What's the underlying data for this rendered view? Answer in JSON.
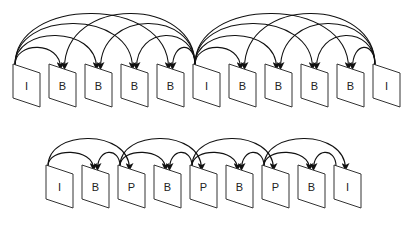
{
  "diagram": {
    "colors": {
      "stroke": "#111111",
      "frame_stroke": "#333333",
      "background": "#ffffff"
    },
    "rows": [
      {
        "id": "hierarchical-b",
        "frame_y": 64,
        "frame_x_start": 13,
        "frame_spacing": 36,
        "frames": [
          "I",
          "B",
          "B",
          "B",
          "B",
          "I",
          "B",
          "B",
          "B",
          "B",
          "I"
        ],
        "arcs": [
          {
            "from": 0,
            "to": 1,
            "h": 18
          },
          {
            "from": 0,
            "to": 2,
            "h": 30
          },
          {
            "from": 0,
            "to": 3,
            "h": 42
          },
          {
            "from": 0,
            "to": 4,
            "h": 52
          },
          {
            "from": 5,
            "to": 4,
            "h": 18
          },
          {
            "from": 5,
            "to": 3,
            "h": 30
          },
          {
            "from": 5,
            "to": 2,
            "h": 42
          },
          {
            "from": 5,
            "to": 1,
            "h": 52
          },
          {
            "from": 5,
            "to": 6,
            "h": 18
          },
          {
            "from": 5,
            "to": 7,
            "h": 30
          },
          {
            "from": 5,
            "to": 8,
            "h": 42
          },
          {
            "from": 5,
            "to": 9,
            "h": 52
          },
          {
            "from": 10,
            "to": 9,
            "h": 18
          },
          {
            "from": 10,
            "to": 8,
            "h": 30
          },
          {
            "from": 10,
            "to": 7,
            "h": 42
          },
          {
            "from": 10,
            "to": 6,
            "h": 52
          }
        ]
      },
      {
        "id": "ibp",
        "frame_y": 165,
        "frame_x_start": 46,
        "frame_spacing": 36,
        "frames": [
          "I",
          "B",
          "P",
          "B",
          "P",
          "B",
          "P",
          "B",
          "I"
        ],
        "arcs": [
          {
            "from": 0,
            "to": 1,
            "h": 14
          },
          {
            "from": 0,
            "to": 2,
            "h": 28
          },
          {
            "from": 2,
            "to": 1,
            "h": 14
          },
          {
            "from": 2,
            "to": 3,
            "h": 14
          },
          {
            "from": 2,
            "to": 4,
            "h": 28
          },
          {
            "from": 4,
            "to": 3,
            "h": 14
          },
          {
            "from": 4,
            "to": 5,
            "h": 14
          },
          {
            "from": 4,
            "to": 6,
            "h": 28
          },
          {
            "from": 6,
            "to": 5,
            "h": 14
          },
          {
            "from": 6,
            "to": 7,
            "h": 14
          },
          {
            "from": 6,
            "to": 8,
            "h": 28
          },
          {
            "from": 8,
            "to": 7,
            "h": 14
          }
        ]
      }
    ]
  }
}
